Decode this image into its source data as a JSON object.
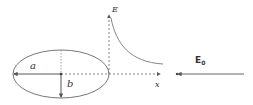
{
  "diagram": {
    "labels": {
      "semi_major": "a",
      "semi_minor": "b",
      "field_axis": "E",
      "x_axis": "x",
      "applied_field": "E",
      "applied_field_sub": "0"
    },
    "colors": {
      "stroke": "#555555",
      "dotted": "#777777",
      "text": "#333333",
      "background": "#ffffff"
    },
    "elements": [
      {
        "id": "ellipse",
        "type": "ellipse",
        "cx": 61,
        "cy": 74,
        "rx": 48,
        "ry": 24
      },
      {
        "id": "semi-major-arrow",
        "type": "arrow",
        "from": [
          61,
          74
        ],
        "to": [
          13,
          74
        ],
        "label": "a"
      },
      {
        "id": "semi-minor-arrow",
        "type": "arrow",
        "from": [
          61,
          74
        ],
        "to": [
          61,
          98
        ],
        "label": "b"
      },
      {
        "id": "e-axis",
        "type": "dotted-arrow",
        "from": [
          109,
          74
        ],
        "to": [
          109,
          14
        ],
        "label": "E"
      },
      {
        "id": "x-axis",
        "type": "dotted-arrow",
        "from": [
          61,
          74
        ],
        "to": [
          161,
          74
        ],
        "label": "x"
      },
      {
        "id": "field-decay-curve",
        "type": "curve",
        "from": [
          111,
          18
        ],
        "to": [
          163,
          64
        ]
      },
      {
        "id": "applied-field-arrow",
        "type": "arrow",
        "from": [
          244,
          74
        ],
        "to": [
          177,
          74
        ],
        "label": "E0"
      }
    ]
  }
}
